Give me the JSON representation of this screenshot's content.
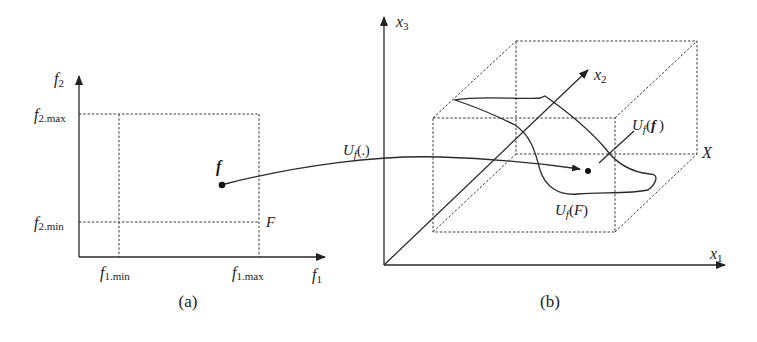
{
  "figure": {
    "panel_a": {
      "caption": "(a)",
      "axis_x_label": "f",
      "axis_x_sub": "1",
      "axis_y_label": "f",
      "axis_y_sub": "2",
      "f1_min_label": "f",
      "f1_min_sub": "1.min",
      "f1_max_label": "f",
      "f1_max_sub": "1.max",
      "f2_min_label": "f",
      "f2_min_sub": "2.min",
      "f2_max_label": "f",
      "f2_max_sub": "2.max",
      "region_label": "F",
      "point_label": "f"
    },
    "mapping_label": "U",
    "mapping_sub": "f",
    "mapping_arg": "(.)",
    "panel_b": {
      "caption": "(b)",
      "axis_x1_label": "x",
      "axis_x1_sub": "1",
      "axis_x2_label": "x",
      "axis_x2_sub": "2",
      "axis_x3_label": "x",
      "axis_x3_sub": "3",
      "box_label": "X",
      "surface_label_main": "U",
      "surface_label_sub": "f",
      "surface_label_arg": "(F)",
      "point_label_main": "U",
      "point_label_sub": "f",
      "point_label_open": "(",
      "point_label_arg": "f",
      "point_label_close": ")"
    }
  }
}
